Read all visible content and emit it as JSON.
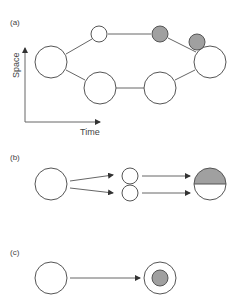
{
  "colors": {
    "stroke": "#555555",
    "edge": "#666666",
    "fill_gray": "#a0a0a0",
    "background": "#ffffff"
  },
  "panels": {
    "a": {
      "label": "(a)",
      "axis": {
        "x_label": "Time",
        "y_label": "Space"
      },
      "nodes": [
        {
          "id": "a-left",
          "cx": 51,
          "cy": 62,
          "r": 16,
          "fill": "white"
        },
        {
          "id": "a-top-small",
          "cx": 99,
          "cy": 34,
          "r": 8,
          "fill": "white"
        },
        {
          "id": "a-top-gray",
          "cx": 160,
          "cy": 34,
          "r": 8,
          "fill": "gray"
        },
        {
          "id": "a-right-gray",
          "cx": 197,
          "cy": 42,
          "r": 8,
          "fill": "gray"
        },
        {
          "id": "a-right",
          "cx": 210,
          "cy": 62,
          "r": 16,
          "fill": "white"
        },
        {
          "id": "a-bottom-left",
          "cx": 100,
          "cy": 88,
          "r": 16,
          "fill": "white"
        },
        {
          "id": "a-bottom-right",
          "cx": 160,
          "cy": 88,
          "r": 16,
          "fill": "white"
        }
      ]
    },
    "b": {
      "label": "(b)",
      "nodes": [
        {
          "id": "b-left",
          "cx": 51,
          "cy": 184,
          "r": 16,
          "fill": "white"
        },
        {
          "id": "b-mid-top",
          "cx": 130,
          "cy": 175,
          "r": 8,
          "fill": "white"
        },
        {
          "id": "b-mid-bottom",
          "cx": 130,
          "cy": 193,
          "r": 8,
          "fill": "white"
        },
        {
          "id": "b-right-half",
          "cx": 210,
          "cy": 184,
          "r": 16,
          "fill": "half-gray-top"
        }
      ]
    },
    "c": {
      "label": "(c)",
      "nodes": [
        {
          "id": "c-left",
          "cx": 51,
          "cy": 278,
          "r": 16,
          "fill": "white"
        },
        {
          "id": "c-right-outer",
          "cx": 160,
          "cy": 278,
          "r": 16,
          "fill": "white"
        },
        {
          "id": "c-right-inner",
          "cx": 160,
          "cy": 278,
          "r": 8,
          "fill": "gray"
        }
      ]
    }
  }
}
